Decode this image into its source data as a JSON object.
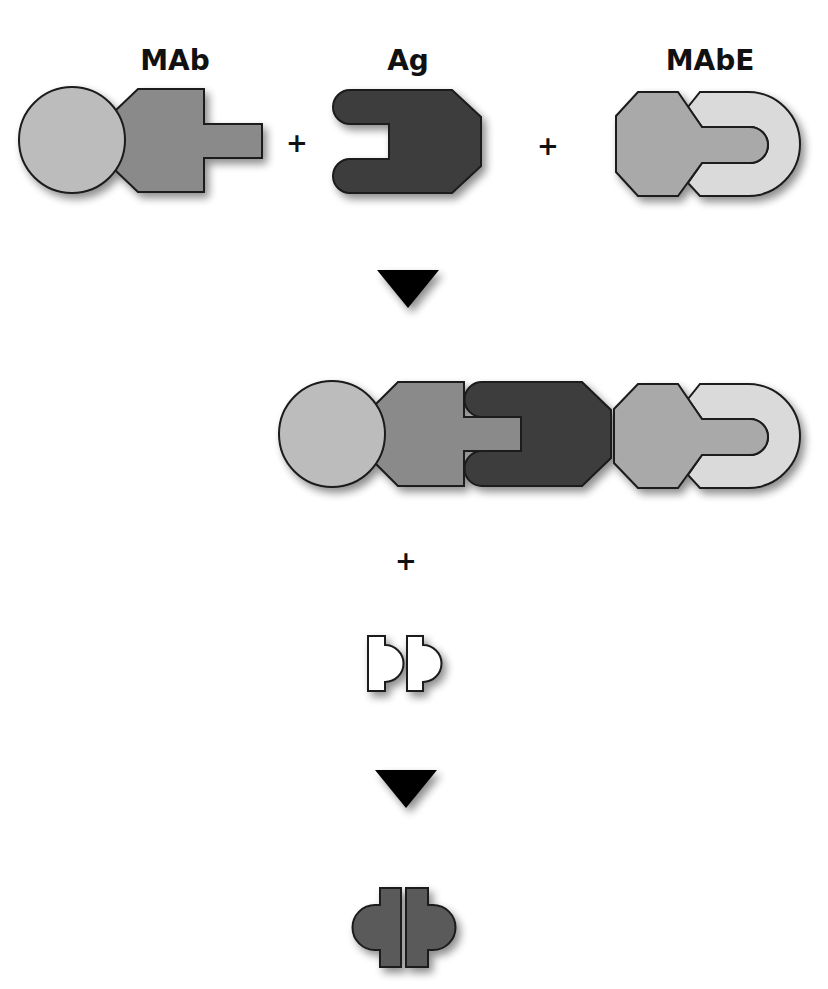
{
  "labels": {
    "mab": "MAb",
    "ag": "Ag",
    "mabe": "MAbE"
  },
  "operators": {
    "plus1": "+",
    "plus2": "+",
    "plus3": "+"
  },
  "colors": {
    "light_gray": "#bcbcbc",
    "mid_gray": "#8a8a8a",
    "dark_gray": "#3e3e3e",
    "pale_gray": "#dadada",
    "enzyme_gray": "#a9a9a9",
    "product_gray": "#5a5a5a",
    "fragment_fill": "#ffffff",
    "outline": "#1a1a1a",
    "arrow": "#000000"
  },
  "steps": [
    {
      "name": "reactants",
      "items": [
        "MAb",
        "Ag",
        "MAbE"
      ]
    },
    {
      "name": "complex",
      "items": [
        "MAb-Ag-MAbE"
      ]
    },
    {
      "name": "substrate",
      "items": [
        "fragment-pair"
      ]
    },
    {
      "name": "product",
      "items": [
        "complemented-enzyme"
      ]
    }
  ]
}
